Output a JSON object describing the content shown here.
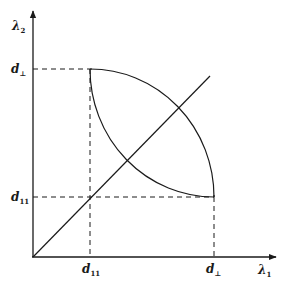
{
  "figure": {
    "axes": {
      "x_label": "λ",
      "x_label_sub": "1",
      "y_label": "λ",
      "y_label_sub": "2"
    },
    "ticks": {
      "x_low": {
        "main": "d",
        "sub": "11"
      },
      "x_high": {
        "main": "d",
        "sub": "⊥"
      },
      "y_low": {
        "main": "d",
        "sub": "11"
      },
      "y_high": {
        "main": "d",
        "sub": "⊥"
      }
    },
    "elements": {
      "diagonal": "line λ1 = λ2",
      "region": "lens-shaped region bounded by two circular arcs between (d11, d⊥) and (d⊥, d11)"
    },
    "colors": {
      "ink": "#1a1a1a",
      "background": "#ffffff"
    }
  }
}
